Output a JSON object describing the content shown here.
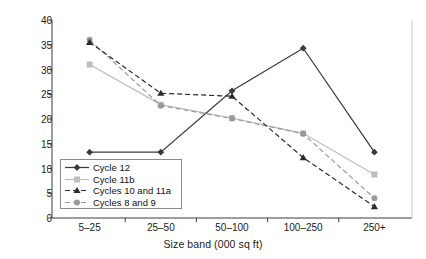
{
  "chart_data": {
    "type": "line",
    "title": "",
    "xlabel": "Size band (000 sq ft)",
    "ylabel": "Share of buildings (%)",
    "categories": [
      "5–25",
      "25–50",
      "50–100",
      "100–250",
      "250+"
    ],
    "ylim": [
      0,
      40
    ],
    "yticks": [
      0,
      5,
      10,
      15,
      20,
      25,
      30,
      35,
      40
    ],
    "ytick_labels": [
      "0",
      "5",
      "10",
      "15",
      "20",
      "25",
      "30",
      "35",
      "40"
    ],
    "grid": false,
    "legend_position": "inside-lower-left",
    "series": [
      {
        "name": "Cycle 12",
        "values": [
          13.3,
          13.3,
          25.7,
          34.3,
          13.3
        ],
        "color": "#3a3a3a",
        "dash": "solid",
        "marker": "diamond"
      },
      {
        "name": "Cycle 11b",
        "values": [
          31.0,
          22.9,
          20.2,
          17.1,
          8.8
        ],
        "color": "#bdbdbd",
        "dash": "solid",
        "marker": "square"
      },
      {
        "name": "Cycles 10 and 11a",
        "values": [
          35.5,
          25.2,
          24.6,
          12.2,
          2.3
        ],
        "color": "#2b2b2b",
        "dash": "dashed",
        "marker": "triangle"
      },
      {
        "name": "Cycles 8 and 9",
        "values": [
          36.0,
          22.7,
          20.1,
          17.0,
          4.0
        ],
        "color": "#9a9a9a",
        "dash": "dashed",
        "marker": "circle"
      }
    ]
  }
}
